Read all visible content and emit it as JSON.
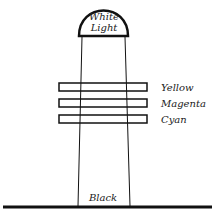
{
  "source": {
    "line1": "White",
    "line2": "Light"
  },
  "filters": [
    {
      "label": "Yellow"
    },
    {
      "label": "Magenta"
    },
    {
      "label": "Cyan"
    }
  ],
  "result": {
    "label": "Black"
  }
}
